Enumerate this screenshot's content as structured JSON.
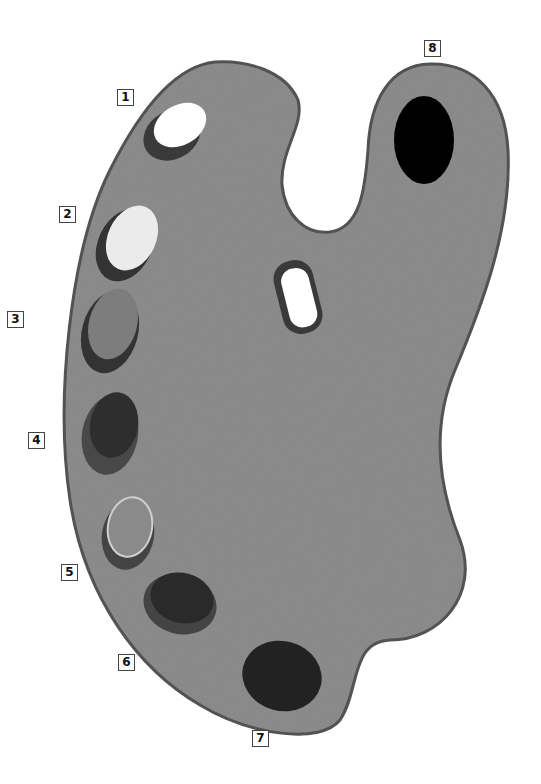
{
  "figure": {
    "palette_color": "#8e8e8e",
    "outline_color": "#555555",
    "thumb_hole_color": "#ffffff"
  },
  "labels": [
    {
      "id": 1,
      "text": "1",
      "x": 117,
      "y": 89,
      "paint_color": "#ffffff"
    },
    {
      "id": 2,
      "text": "2",
      "x": 59,
      "y": 206,
      "paint_color": "#ebebeb"
    },
    {
      "id": 3,
      "text": "3",
      "x": 7,
      "y": 311,
      "paint_color": "#7d7d7d"
    },
    {
      "id": 4,
      "text": "4",
      "x": 28,
      "y": 432,
      "paint_color": "#2e2e2e"
    },
    {
      "id": 5,
      "text": "5",
      "x": 61,
      "y": 564,
      "paint_color": "#8a8a8a"
    },
    {
      "id": 6,
      "text": "6",
      "x": 118,
      "y": 654,
      "paint_color": "#2a2a2a"
    },
    {
      "id": 7,
      "text": "7",
      "x": 252,
      "y": 730,
      "paint_color": "#222222"
    },
    {
      "id": 8,
      "text": "8",
      "x": 424,
      "y": 40,
      "paint_color": "#000000"
    }
  ]
}
